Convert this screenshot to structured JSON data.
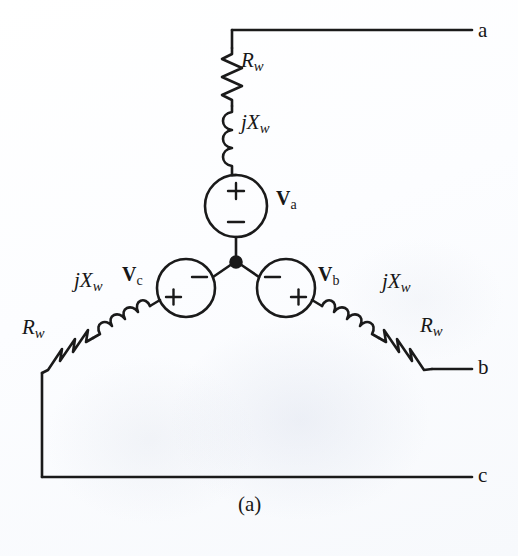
{
  "figure": {
    "caption": "(a)",
    "type": "three-phase wye-connected source circuit schematic",
    "background_color": "#fdfdfd",
    "line_color": "#1a1a1a"
  },
  "terminals": [
    {
      "id": "a",
      "label": "a",
      "x": 484,
      "y": 32
    },
    {
      "id": "b",
      "label": "b",
      "x": 484,
      "y": 369
    },
    {
      "id": "c",
      "label": "c",
      "x": 484,
      "y": 477
    }
  ],
  "sources": [
    {
      "id": "Va",
      "label_main": "V",
      "label_sub": "a",
      "plus_position": "top",
      "minus_position": "bottom",
      "cx": 236,
      "cy": 206,
      "r": 31,
      "label_x": 276,
      "label_y": 196
    },
    {
      "id": "Vc",
      "label_main": "V",
      "label_sub": "c",
      "plus_position": "lower-left",
      "minus_position": "upper-right",
      "cx": 186,
      "cy": 288,
      "r": 29,
      "label_x": 122,
      "label_y": 272
    },
    {
      "id": "Vb",
      "label_main": "V",
      "label_sub": "b",
      "plus_position": "lower-right",
      "minus_position": "upper-left",
      "cx": 286,
      "cy": 288,
      "r": 29,
      "label_x": 318,
      "label_y": 272
    }
  ],
  "components": [
    {
      "id": "Rw-a",
      "kind": "resistor",
      "main": "R",
      "sub": "w",
      "label_x": 241,
      "label_y": 60,
      "branch": "a"
    },
    {
      "id": "jXw-a",
      "kind": "inductor",
      "prefix": "j",
      "main": "X",
      "sub": "w",
      "label_x": 241,
      "label_y": 122,
      "branch": "a"
    },
    {
      "id": "jXw-c",
      "kind": "inductor",
      "prefix": "j",
      "main": "X",
      "sub": "w",
      "label_x": 74,
      "label_y": 280,
      "branch": "c"
    },
    {
      "id": "Rw-c",
      "kind": "resistor",
      "main": "R",
      "sub": "w",
      "label_x": 22,
      "label_y": 327,
      "branch": "c"
    },
    {
      "id": "jXw-b",
      "kind": "inductor",
      "prefix": "j",
      "main": "X",
      "sub": "w",
      "label_x": 382,
      "label_y": 281,
      "branch": "b"
    },
    {
      "id": "Rw-b",
      "kind": "resistor",
      "main": "R",
      "sub": "w",
      "label_x": 420,
      "label_y": 325,
      "branch": "b"
    }
  ],
  "node": {
    "id": "neutral-node",
    "cx": 236,
    "cy": 262,
    "r": 5.5
  },
  "signs": {
    "plus": "+",
    "minus": "−"
  }
}
